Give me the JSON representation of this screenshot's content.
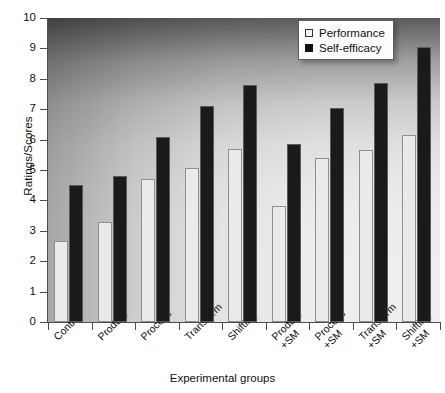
{
  "chart_data": {
    "type": "bar",
    "title": "",
    "xlabel": "Experimental groups",
    "ylabel": "Ratings/Scores",
    "ylim": [
      0,
      10
    ],
    "ytick_labels": [
      "0",
      "1",
      "2",
      "3",
      "4",
      "5",
      "6",
      "7",
      "8",
      "9",
      "10"
    ],
    "ytick_values": [
      0,
      1,
      2,
      3,
      4,
      5,
      6,
      7,
      8,
      9,
      10
    ],
    "grid": false,
    "legend_position": "top-right",
    "categories": [
      "Control",
      "Product",
      "Process",
      "Transform",
      "Shifting",
      "Product\n+SM",
      "Process\n+SM",
      "Transform\n+SM",
      "Shifting\n+SM"
    ],
    "series": [
      {
        "name": "Performance",
        "color": "#eaeaea",
        "values": [
          2.65,
          3.3,
          4.7,
          5.05,
          5.7,
          3.8,
          5.4,
          5.65,
          6.15
        ]
      },
      {
        "name": "Self-efficacy",
        "color": "#1a1a1a",
        "values": [
          4.5,
          4.8,
          6.1,
          7.1,
          7.8,
          5.85,
          7.05,
          7.85,
          9.05
        ]
      }
    ]
  },
  "legend": {
    "items": [
      {
        "label": "Performance",
        "swatch": "open-square-icon"
      },
      {
        "label": "Self-efficacy",
        "swatch": "filled-square-icon"
      }
    ]
  }
}
